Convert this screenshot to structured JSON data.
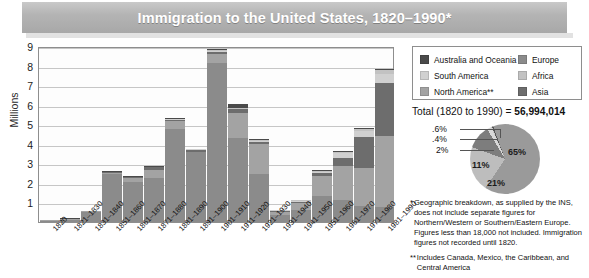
{
  "title": "Immigration to the United States, 1820–1990*",
  "axis": {
    "ylabel": "Millions",
    "yticks": [
      "9",
      "8",
      "7",
      "6",
      "5",
      "4",
      "3",
      "2",
      "1"
    ]
  },
  "legend": {
    "left": [
      {
        "label": "Australia and Oceania",
        "color": "#4a4a4a"
      },
      {
        "label": "South America",
        "color": "#d0d0d0"
      },
      {
        "label": "North America**",
        "color": "#a3a3a3"
      }
    ],
    "right": [
      {
        "label": "Europe",
        "color": "#8b8b8b"
      },
      {
        "label": "Africa",
        "color": "#c2c2c2"
      },
      {
        "label": "Asia",
        "color": "#6d6d6d"
      }
    ]
  },
  "total": {
    "prefix": "Total (1820 to 1990) = ",
    "value": "56,994,014"
  },
  "footnotes": [
    {
      "mark": "*",
      "text": "Geographic breakdown, as supplied by the INS, does not include separate figures for Northern/Western or Southern/Eastern Europe. Figures less than 18,000 not included. Immigration figures not recorded until 1820."
    },
    {
      "mark": "**",
      "text": "Includes Canada, Mexico, the Caribbean, and Central America"
    }
  ],
  "chart_data": {
    "type": "bar",
    "title": "Immigration to the United States, 1820–1990*",
    "xlabel": "",
    "ylabel": "Millions",
    "ylim": [
      0,
      9
    ],
    "grid": true,
    "stacked": true,
    "categories": [
      "1820",
      "1821–1830",
      "1831–1840",
      "1851–1860",
      "1861–1870",
      "1871–1880",
      "1881–1890",
      "1891–1900",
      "1901–1910",
      "1911–1920",
      "1921–1930",
      "1931–1940",
      "1941–1950",
      "1951–1960",
      "1961–1970",
      "1971–1980",
      "1981–1990"
    ],
    "series": [
      {
        "name": "Europe",
        "color": "#8b8b8b",
        "values": [
          0.008,
          0.1,
          0.5,
          2.45,
          2.06,
          2.27,
          4.74,
          3.56,
          8.14,
          4.32,
          2.48,
          0.35,
          0.62,
          1.33,
          1.12,
          0.8,
          0.76
        ]
      },
      {
        "name": "North America**",
        "color": "#a3a3a3",
        "values": [
          0.002,
          0.01,
          0.03,
          0.07,
          0.17,
          0.4,
          0.43,
          0.04,
          0.43,
          1.25,
          1.52,
          0.16,
          0.36,
          1.02,
          1.72,
          1.98,
          3.62
        ]
      },
      {
        "name": "Asia",
        "color": "#6d6d6d",
        "values": [
          0.0,
          0.0,
          0.0,
          0.04,
          0.06,
          0.12,
          0.07,
          0.07,
          0.14,
          0.19,
          0.11,
          0.02,
          0.03,
          0.15,
          0.43,
          1.59,
          2.74
        ]
      },
      {
        "name": "South America",
        "color": "#d0d0d0",
        "values": [
          0.0,
          0.0,
          0.0,
          0.0,
          0.0,
          0.01,
          0.01,
          0.01,
          0.02,
          0.04,
          0.04,
          0.01,
          0.02,
          0.08,
          0.26,
          0.3,
          0.46
        ]
      },
      {
        "name": "Africa",
        "color": "#c2c2c2",
        "values": [
          0.0,
          0.0,
          0.0,
          0.0,
          0.0,
          0.0,
          0.0,
          0.0,
          0.01,
          0.01,
          0.01,
          0.0,
          0.01,
          0.01,
          0.03,
          0.08,
          0.18
        ]
      },
      {
        "name": "Australia and Oceania",
        "color": "#4a4a4a",
        "values": [
          0.0,
          0.005,
          0.01,
          0.02,
          0.03,
          0.04,
          0.05,
          0.04,
          0.06,
          0.2,
          0.06,
          0.01,
          0.02,
          0.02,
          0.03,
          0.04,
          0.05
        ]
      }
    ],
    "totals": [
      0.01,
      0.12,
      0.54,
      2.6,
      2.31,
      2.81,
      5.25,
      3.69,
      8.8,
      5.74,
      4.11,
      0.53,
      1.03,
      2.52,
      3.32,
      4.49,
      7.34
    ],
    "pie": {
      "type": "pie",
      "title": "Total (1820 to 1990) = 56,994,014",
      "slices": [
        {
          "label": "65%",
          "value": 65,
          "name": "Europe",
          "color": "#9a9a9a"
        },
        {
          "label": "21%",
          "value": 21,
          "name": "North America**",
          "color": "#bdbdbd"
        },
        {
          "label": "11%",
          "value": 11,
          "name": "Asia",
          "color": "#7d7d7d"
        },
        {
          "label": "2%",
          "value": 2,
          "name": "South America",
          "color": "#d8d8d8"
        },
        {
          "label": ".4%",
          "value": 0.4,
          "name": "Africa",
          "color": "#c8c8c8"
        },
        {
          "label": ".6%",
          "value": 0.6,
          "name": "Australia and Oceania",
          "color": "#555555"
        }
      ]
    }
  }
}
